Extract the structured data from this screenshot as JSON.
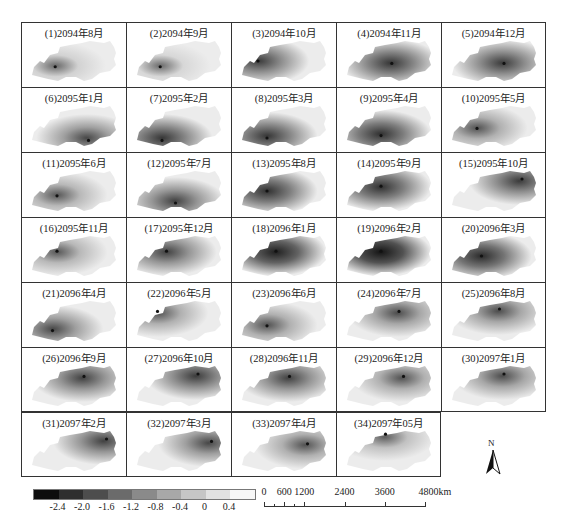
{
  "panels": [
    {
      "label": "(1)2094年8月",
      "intensity": 0.15,
      "hot": [
        0.28,
        0.62
      ]
    },
    {
      "label": "(2)2094年9月",
      "intensity": 0.12,
      "hot": [
        0.28,
        0.62
      ]
    },
    {
      "label": "(3)2094年10月",
      "intensity": 0.55,
      "hot": [
        0.2,
        0.5
      ]
    },
    {
      "label": "(4)2094年11月",
      "intensity": 0.6,
      "hot": [
        0.52,
        0.55
      ]
    },
    {
      "label": "(5)2094年12月",
      "intensity": 0.55,
      "hot": [
        0.6,
        0.55
      ]
    },
    {
      "label": "(6)2095年1月",
      "intensity": 0.45,
      "hot": [
        0.65,
        0.8
      ]
    },
    {
      "label": "(7)2095年2月",
      "intensity": 0.6,
      "hot": [
        0.3,
        0.8
      ]
    },
    {
      "label": "(8)2095年3月",
      "intensity": 0.6,
      "hot": [
        0.3,
        0.75
      ]
    },
    {
      "label": "(9)2095年4月",
      "intensity": 0.65,
      "hot": [
        0.4,
        0.7
      ]
    },
    {
      "label": "(10)2095年5月",
      "intensity": 0.35,
      "hot": [
        0.3,
        0.55
      ]
    },
    {
      "label": "(11)2095年6月",
      "intensity": 0.3,
      "hot": [
        0.3,
        0.6
      ]
    },
    {
      "label": "(12)2095年7月",
      "intensity": 0.5,
      "hot": [
        0.45,
        0.75
      ]
    },
    {
      "label": "(13)2095年8月",
      "intensity": 0.65,
      "hot": [
        0.3,
        0.5
      ]
    },
    {
      "label": "(14)2095年9月",
      "intensity": 0.65,
      "hot": [
        0.4,
        0.4
      ]
    },
    {
      "label": "(15)2095年10月",
      "intensity": 0.55,
      "hot": [
        0.8,
        0.25
      ]
    },
    {
      "label": "(16)2095年11月",
      "intensity": 0.3,
      "hot": [
        0.3,
        0.4
      ]
    },
    {
      "label": "(17)2095年12月",
      "intensity": 0.5,
      "hot": [
        0.35,
        0.4
      ]
    },
    {
      "label": "(18)2096年1月",
      "intensity": 0.8,
      "hot": [
        0.4,
        0.4
      ]
    },
    {
      "label": "(19)2096年2月",
      "intensity": 0.9,
      "hot": [
        0.4,
        0.4
      ]
    },
    {
      "label": "(20)2096年3月",
      "intensity": 0.7,
      "hot": [
        0.35,
        0.5
      ]
    },
    {
      "label": "(21)2096年4月",
      "intensity": 0.45,
      "hot": [
        0.25,
        0.7
      ]
    },
    {
      "label": "(22)2096年5月",
      "intensity": 0.35,
      "hot": [
        0.25,
        0.3
      ]
    },
    {
      "label": "(23)2096年6月",
      "intensity": 0.35,
      "hot": [
        0.3,
        0.6
      ]
    },
    {
      "label": "(24)2096年7月",
      "intensity": 0.4,
      "hot": [
        0.6,
        0.3
      ]
    },
    {
      "label": "(25)2096年8月",
      "intensity": 0.4,
      "hot": [
        0.55,
        0.25
      ]
    },
    {
      "label": "(26)2096年9月",
      "intensity": 0.5,
      "hot": [
        0.6,
        0.3
      ]
    },
    {
      "label": "(27)2096年10月",
      "intensity": 0.55,
      "hot": [
        0.7,
        0.25
      ]
    },
    {
      "label": "(28)2096年11月",
      "intensity": 0.5,
      "hot": [
        0.55,
        0.3
      ]
    },
    {
      "label": "(29)2096年12月",
      "intensity": 0.35,
      "hot": [
        0.65,
        0.3
      ]
    },
    {
      "label": "(30)2097年1月",
      "intensity": 0.4,
      "hot": [
        0.6,
        0.25
      ]
    },
    {
      "label": "(31)2097年2月",
      "intensity": 0.5,
      "hot": [
        0.85,
        0.25
      ]
    },
    {
      "label": "(32)2097年3月",
      "intensity": 0.45,
      "hot": [
        0.85,
        0.3
      ]
    },
    {
      "label": "(33)2097年4月",
      "intensity": 0.35,
      "hot": [
        0.75,
        0.35
      ]
    },
    {
      "label": "(34)2097年05月",
      "intensity": 0.25,
      "hot": [
        0.45,
        0.15
      ]
    }
  ],
  "legend": {
    "colors": [
      "#0d0d0d",
      "#2e2e2e",
      "#4d4d4d",
      "#6b6b6b",
      "#8a8a8a",
      "#a8a8a8",
      "#c6c6c6",
      "#e2e2e2",
      "#f7f7f7"
    ],
    "ticks": [
      "-2.4",
      "-2.0",
      "-1.6",
      "-1.2",
      "-0.8",
      "-0.4",
      "0",
      "0.4"
    ]
  },
  "scale_bar": {
    "labels": [
      "0",
      "600",
      "1200",
      "2400",
      "3600",
      "4800km"
    ],
    "values": [
      0,
      600,
      1200,
      2400,
      3600,
      4800
    ]
  },
  "north_arrow": {
    "label": "N"
  }
}
